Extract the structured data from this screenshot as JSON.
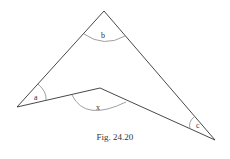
{
  "figure": {
    "caption": "Fig. 24.20",
    "angle_labels": {
      "a": "a",
      "b": "b",
      "x": "x",
      "c": "c"
    },
    "vertices": {
      "top": [
        104,
        11
      ],
      "left": [
        17,
        107
      ],
      "inner": [
        100,
        88
      ],
      "right": [
        215,
        140
      ]
    },
    "colors": {
      "line": "#333333",
      "arc": "#999999"
    }
  }
}
